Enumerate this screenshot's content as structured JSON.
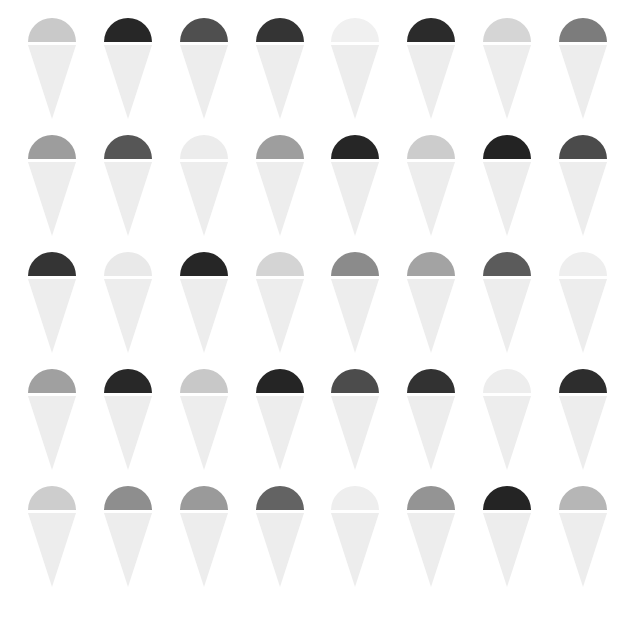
{
  "canvas": {
    "width": 635,
    "height": 617,
    "background_color": "#ffffff",
    "title": "Grayscale Cone Icon Grid"
  },
  "icon": {
    "name": "ice-cream-cone-icon",
    "shape": "semicircular-dome-over-inverted-triangle",
    "dome_width": 48,
    "dome_height": 24,
    "cone_height": 53,
    "gap_between_dome_and_cone": 2,
    "default_cone_color": "#ededed"
  },
  "grid": {
    "rows": 5,
    "columns": 8,
    "total_icons": 40,
    "row_pitch": 115,
    "column_pitch": 73
  },
  "palette": {
    "near_white": "#f4f4f4",
    "very_light_gray": "#ebebeb",
    "light_gray": "#dcdcdc",
    "light_medium_gray": "#cfcfcf",
    "medium_light_gray": "#bdbdbd",
    "medium_gray": "#a6a6a6",
    "medium_dark_gray": "#8f8f8f",
    "dark_gray": "#6e6e6e",
    "darker_gray": "#4a4a4a",
    "very_dark_gray": "#333333",
    "near_black": "#262626",
    "cone_light": "#ededed",
    "cone_lighter": "#f1f1f1"
  },
  "rows": [
    {
      "index": 1,
      "label": "row-1",
      "icons": [
        {
          "index": 1,
          "dome_color": "#c9c9c9",
          "cone_color": "#ededed",
          "tone": "light-gray"
        },
        {
          "index": 2,
          "dome_color": "#272727",
          "cone_color": "#ededed",
          "tone": "near-black"
        },
        {
          "index": 3,
          "dome_color": "#4f4f4f",
          "cone_color": "#ededed",
          "tone": "darker-gray"
        },
        {
          "index": 4,
          "dome_color": "#343434",
          "cone_color": "#ededed",
          "tone": "very-dark-gray"
        },
        {
          "index": 5,
          "dome_color": "#f0f0f0",
          "cone_color": "#ededed",
          "tone": "near-white"
        },
        {
          "index": 6,
          "dome_color": "#2b2b2b",
          "cone_color": "#ededed",
          "tone": "near-black"
        },
        {
          "index": 7,
          "dome_color": "#d5d5d5",
          "cone_color": "#ededed",
          "tone": "light-gray"
        },
        {
          "index": 8,
          "dome_color": "#7c7c7c",
          "cone_color": "#ededed",
          "tone": "dark-gray"
        }
      ]
    },
    {
      "index": 2,
      "label": "row-2",
      "icons": [
        {
          "index": 1,
          "dome_color": "#9d9d9d",
          "cone_color": "#ededed",
          "tone": "medium-gray"
        },
        {
          "index": 2,
          "dome_color": "#565656",
          "cone_color": "#ededed",
          "tone": "darker-gray"
        },
        {
          "index": 3,
          "dome_color": "#ececec",
          "cone_color": "#ededed",
          "tone": "very-light-gray"
        },
        {
          "index": 4,
          "dome_color": "#9e9e9e",
          "cone_color": "#ededed",
          "tone": "medium-gray"
        },
        {
          "index": 5,
          "dome_color": "#262626",
          "cone_color": "#ededed",
          "tone": "near-black"
        },
        {
          "index": 6,
          "dome_color": "#cccccc",
          "cone_color": "#ededed",
          "tone": "light-gray"
        },
        {
          "index": 7,
          "dome_color": "#232323",
          "cone_color": "#ededed",
          "tone": "near-black"
        },
        {
          "index": 8,
          "dome_color": "#4b4b4b",
          "cone_color": "#ededed",
          "tone": "darker-gray"
        }
      ]
    },
    {
      "index": 3,
      "label": "row-3",
      "icons": [
        {
          "index": 1,
          "dome_color": "#343434",
          "cone_color": "#ededed",
          "tone": "very-dark-gray"
        },
        {
          "index": 2,
          "dome_color": "#e9e9e9",
          "cone_color": "#ededed",
          "tone": "very-light-gray"
        },
        {
          "index": 3,
          "dome_color": "#262626",
          "cone_color": "#ededed",
          "tone": "near-black"
        },
        {
          "index": 4,
          "dome_color": "#d4d4d4",
          "cone_color": "#ededed",
          "tone": "light-gray"
        },
        {
          "index": 5,
          "dome_color": "#8b8b8b",
          "cone_color": "#ededed",
          "tone": "medium-dark-gray"
        },
        {
          "index": 6,
          "dome_color": "#a3a3a3",
          "cone_color": "#ededed",
          "tone": "medium-gray"
        },
        {
          "index": 7,
          "dome_color": "#5b5b5b",
          "cone_color": "#ededed",
          "tone": "darker-gray"
        },
        {
          "index": 8,
          "dome_color": "#eeeeee",
          "cone_color": "#ededed",
          "tone": "near-white"
        }
      ]
    },
    {
      "index": 4,
      "label": "row-4",
      "icons": [
        {
          "index": 1,
          "dome_color": "#a0a0a0",
          "cone_color": "#ededed",
          "tone": "medium-gray"
        },
        {
          "index": 2,
          "dome_color": "#282828",
          "cone_color": "#ededed",
          "tone": "near-black"
        },
        {
          "index": 3,
          "dome_color": "#c8c8c8",
          "cone_color": "#ededed",
          "tone": "light-gray"
        },
        {
          "index": 4,
          "dome_color": "#252525",
          "cone_color": "#ededed",
          "tone": "near-black"
        },
        {
          "index": 5,
          "dome_color": "#4c4c4c",
          "cone_color": "#ededed",
          "tone": "darker-gray"
        },
        {
          "index": 6,
          "dome_color": "#323232",
          "cone_color": "#ededed",
          "tone": "very-dark-gray"
        },
        {
          "index": 7,
          "dome_color": "#ededed",
          "cone_color": "#ededed",
          "tone": "very-light-gray"
        },
        {
          "index": 8,
          "dome_color": "#2d2d2d",
          "cone_color": "#ededed",
          "tone": "near-black"
        }
      ]
    },
    {
      "index": 5,
      "label": "row-5",
      "icons": [
        {
          "index": 1,
          "dome_color": "#cdcdcd",
          "cone_color": "#ededed",
          "tone": "light-gray"
        },
        {
          "index": 2,
          "dome_color": "#8e8e8e",
          "cone_color": "#ededed",
          "tone": "medium-dark-gray"
        },
        {
          "index": 3,
          "dome_color": "#9a9a9a",
          "cone_color": "#ededed",
          "tone": "medium-gray"
        },
        {
          "index": 4,
          "dome_color": "#636363",
          "cone_color": "#ededed",
          "tone": "dark-gray"
        },
        {
          "index": 5,
          "dome_color": "#eeeeee",
          "cone_color": "#ededed",
          "tone": "near-white"
        },
        {
          "index": 6,
          "dome_color": "#949494",
          "cone_color": "#ededed",
          "tone": "medium-gray"
        },
        {
          "index": 7,
          "dome_color": "#242424",
          "cone_color": "#ededed",
          "tone": "near-black"
        },
        {
          "index": 8,
          "dome_color": "#b6b6b6",
          "cone_color": "#ededed",
          "tone": "medium-light-gray"
        }
      ]
    }
  ]
}
